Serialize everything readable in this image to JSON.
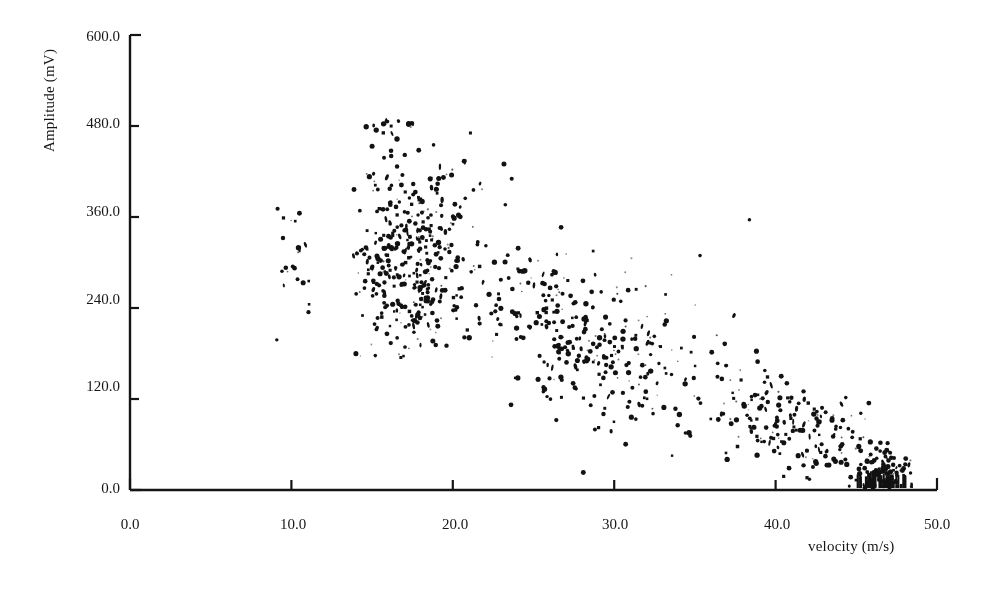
{
  "chart_data": {
    "type": "scatter",
    "title": "",
    "xlabel": "velocity (m/s)",
    "ylabel": "Amplitude (mV)",
    "xlim": [
      0.0,
      50.0
    ],
    "ylim": [
      0.0,
      600.0
    ],
    "xticks": [
      0.0,
      10.0,
      20.0,
      30.0,
      40.0,
      50.0
    ],
    "yticks": [
      0.0,
      120.0,
      240.0,
      360.0,
      480.0,
      600.0
    ],
    "xtick_labels": [
      "0.0",
      "10.0",
      "20.0",
      "30.0",
      "40.0",
      "50.0"
    ],
    "ytick_labels": [
      "0.0",
      "120.0",
      "240.0",
      "360.0",
      "480.0",
      "600.0"
    ],
    "grid": false,
    "legend": null,
    "marker": "dot",
    "marker_color": "#121212",
    "marker_size_px": 3,
    "point_count_approx": 900,
    "series": [
      {
        "name": "amplitude vs velocity",
        "color": "#121212",
        "clusters": [
          {
            "name": "low-velocity isolated group",
            "n": 22,
            "x_range": [
              9.0,
              11.6
            ],
            "y_center": 300,
            "y_spread": 55,
            "x_center": 10.2,
            "x_spread": 0.7
          },
          {
            "name": "saturation ceiling",
            "n": 16,
            "x_range": [
              14.3,
              19.2
            ],
            "y_center": 481,
            "y_spread": 5,
            "x_center": 16.5,
            "x_spread": 1.5
          },
          {
            "name": "main dense core",
            "n": 330,
            "x_range": [
              13.8,
              22.0
            ],
            "y_center": 285,
            "y_spread": 58,
            "x_center": 17.2,
            "x_spread": 1.9
          },
          {
            "name": "upper tail",
            "n": 55,
            "x_range": [
              14.0,
              24.5
            ],
            "y_center": 395,
            "y_spread": 45,
            "x_center": 18.0,
            "x_spread": 2.6
          },
          {
            "name": "mid descending band",
            "n": 290,
            "x_range": [
              21.0,
              38.0
            ],
            "y_center": 0,
            "y_spread": 48,
            "x_center": 28.0,
            "x_spread": 4.3
          },
          {
            "name": "low descending band",
            "n": 180,
            "x_range": [
              36.0,
              47.0
            ],
            "y_center": 0,
            "y_spread": 32,
            "x_center": 41.0,
            "x_spread": 2.9
          },
          {
            "name": "axis pile-up",
            "n": 95,
            "x_range": [
              44.8,
              48.4
            ],
            "y_center": 22,
            "y_spread": 18,
            "x_center": 46.9,
            "x_spread": 0.9
          },
          {
            "name": "sparse outliers",
            "n": 30,
            "x_range": [
              24.0,
              44.0
            ],
            "y_center": 210,
            "y_spread": 60,
            "x_center": 32.0,
            "x_spread": 5.5
          }
        ],
        "trend": {
          "type": "linear-decreasing",
          "from": [
            14.0,
            330.0
          ],
          "to": [
            48.0,
            15.0
          ]
        }
      }
    ]
  },
  "axes": {
    "x_axis_name": "velocity-axis",
    "y_axis_name": "amplitude-axis"
  }
}
